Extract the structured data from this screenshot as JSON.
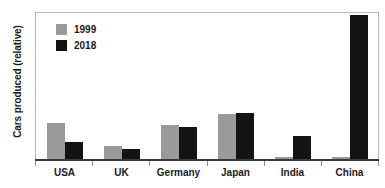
{
  "chart_data": {
    "type": "bar",
    "title": "",
    "subtitle": "",
    "xlabel": "",
    "ylabel": "Cars produced (relative)",
    "categories": [
      "USA",
      "UK",
      "Germany",
      "Japan",
      "India",
      "China"
    ],
    "series": [
      {
        "name": "1999",
        "color": "#9a9a9a",
        "values": [
          24,
          9,
          23,
          30,
          2,
          2
        ]
      },
      {
        "name": "2018",
        "color": "#131313",
        "values": [
          11.5,
          7,
          21.5,
          31,
          16,
          95
        ]
      }
    ],
    "ylim": [
      0,
      100
    ],
    "yticks": [],
    "ytick_labels": [],
    "grid": false,
    "legend_position": "top-left",
    "legend_entries": [
      "1999",
      "2018"
    ],
    "annotations": []
  },
  "axes": {
    "y_title": "Cars produced (relative)"
  },
  "legend": {
    "items": [
      {
        "label": "1999",
        "color": "#9a9a9a"
      },
      {
        "label": "2018",
        "color": "#131313"
      }
    ]
  },
  "colors": {
    "series_1999": "#9a9a9a",
    "series_2018": "#131313",
    "frame": "#b9b9b9",
    "axis": "#3a3a3a",
    "background": "#ffffff",
    "text": "#1a1a1a"
  }
}
